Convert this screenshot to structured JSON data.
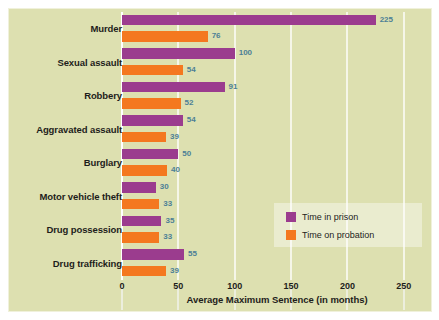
{
  "chart_data": {
    "type": "bar",
    "orientation": "horizontal",
    "title": "",
    "xlabel": "Average Maximum Sentence (in months)",
    "ylabel": "",
    "xlim": [
      0,
      275
    ],
    "xticks": [
      0,
      50,
      100,
      150,
      200,
      250
    ],
    "xtick_labels": [
      "0",
      "50",
      "100",
      "150",
      "200",
      "250"
    ],
    "grid": true,
    "grid_axis": "x",
    "legend_position": "lower-right",
    "categories": [
      "Murder",
      "Sexual assault",
      "Robbery",
      "Aggravated assault",
      "Burglary",
      "Motor vehicle theft",
      "Drug possession",
      "Drug trafficking"
    ],
    "series": [
      {
        "name": "Time in prison",
        "color": "#9b3c8e",
        "values": [
          225,
          100,
          91,
          54,
          50,
          30,
          35,
          55
        ]
      },
      {
        "name": "Time on probation",
        "color": "#f4781f",
        "values": [
          76,
          54,
          52,
          39,
          40,
          33,
          33,
          39
        ]
      }
    ],
    "value_label_color": "#4c7f96",
    "background_color": "#dde0b0",
    "gridline_color": "#f5f6e8"
  },
  "legend": {
    "items": [
      {
        "label": "Time in prison",
        "swatch": "prison"
      },
      {
        "label": "Time on probation",
        "swatch": "probation"
      }
    ]
  }
}
